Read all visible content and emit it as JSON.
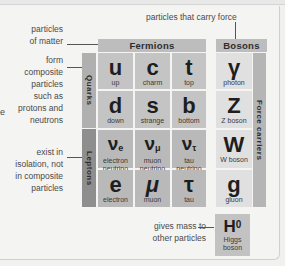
{
  "annotations": {
    "matter": [
      "particles",
      "of matter"
    ],
    "force": "particles that carry force",
    "composite": [
      "form",
      "composite",
      "particles",
      "such as",
      "protons and",
      "neutrons"
    ],
    "isolation": [
      "exist in",
      "isolation, not",
      "in composite",
      "particles"
    ],
    "mass": [
      "gives mass to",
      "other particles"
    ],
    "cut_left": "e"
  },
  "headers": {
    "fermions": "Fermions",
    "bosons": "Bosons",
    "quarks": "Quarks",
    "leptons": "Leptons",
    "force_carriers": "Force carriers"
  },
  "quarks": [
    {
      "symbol": "u",
      "name": "up"
    },
    {
      "symbol": "c",
      "name": "charm"
    },
    {
      "symbol": "t",
      "name": "top"
    },
    {
      "symbol": "d",
      "name": "down"
    },
    {
      "symbol": "s",
      "name": "strange"
    },
    {
      "symbol": "b",
      "name": "bottom"
    }
  ],
  "leptons": [
    {
      "symbol": "ν",
      "sub": "e",
      "name1": "electron",
      "name2": "neutrino"
    },
    {
      "symbol": "ν",
      "sub": "μ",
      "name1": "muon",
      "name2": "neutrino"
    },
    {
      "symbol": "ν",
      "sub": "τ",
      "name1": "tau",
      "name2": "neutrino"
    },
    {
      "symbol": "e",
      "name1": "electron"
    },
    {
      "symbol": "μ",
      "name1": "muon"
    },
    {
      "symbol": "τ",
      "name1": "tau"
    }
  ],
  "bosons": [
    {
      "symbol": "γ",
      "name": "photon"
    },
    {
      "symbol": "Z",
      "name": "Z boson"
    },
    {
      "symbol": "W",
      "name": "W boson"
    },
    {
      "symbol": "g",
      "name": "gluon"
    }
  ],
  "higgs": {
    "symbol": "H",
    "sup": "0",
    "name1": "Higgs",
    "name2": "boson"
  }
}
